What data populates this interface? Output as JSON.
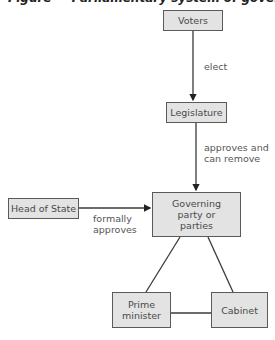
{
  "title": "Figure — Parliamentary system of government",
  "nodes": {
    "voters": "Voters",
    "legislature": "Legislature",
    "head_of_state": "Head of State",
    "governing": "Governing party or parties",
    "prime_minister": "Prime minister",
    "cabinet": "Cabinet"
  },
  "edges": {
    "elect": "elect",
    "approves_remove": "approves and can remove",
    "formally_approves": "formally approves"
  },
  "colors": {
    "box_fill": "#e3e3e3",
    "box_border": "#5a5a5a",
    "line": "#3a3a3a"
  }
}
